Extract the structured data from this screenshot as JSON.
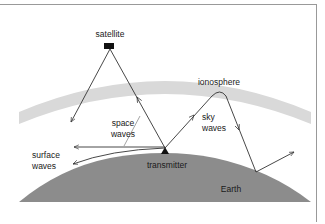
{
  "diagram": {
    "labels": {
      "satellite": "satellite",
      "ionosphere": "ionosphere",
      "space_waves_line1": "space",
      "space_waves_line2": "waves",
      "sky_waves_line1": "sky",
      "sky_waves_line2": "waves",
      "surface_waves_line1": "surface",
      "surface_waves_line2": "waves",
      "transmitter": "transmitter",
      "earth": "Earth"
    },
    "colors": {
      "earth": "#8c8c8c",
      "ionosphere": "#d9d9d9",
      "lines": "#333333",
      "satellite": "#111111",
      "frame": "#888888"
    }
  }
}
